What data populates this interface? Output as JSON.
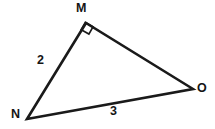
{
  "figure": {
    "name": "right-triangle-mno",
    "kind": "geometry-diagram",
    "background_color": "#ffffff",
    "stroke_color": "#1a1a1a",
    "text_color": "#151515",
    "stroke_width": 2.6,
    "vertices": [
      {
        "id": "M",
        "label": "M",
        "x": 86,
        "y": 23
      },
      {
        "id": "N",
        "label": "N",
        "x": 27,
        "y": 119
      },
      {
        "id": "O",
        "label": "O",
        "x": 193,
        "y": 89
      }
    ],
    "edges": [
      {
        "id": "MN",
        "from": "M",
        "to": "N",
        "label": "2"
      },
      {
        "id": "MO",
        "from": "M",
        "to": "O",
        "label": ""
      },
      {
        "id": "NO",
        "from": "N",
        "to": "O",
        "label": "3"
      }
    ],
    "angle_markers": [
      {
        "id": "right-angle-at-M",
        "at": "M",
        "type": "square",
        "size": 11
      }
    ],
    "side_labels": {
      "MN": "2",
      "NO": "3"
    },
    "vertex_labels": {
      "M": "M",
      "N": "N",
      "O": "O"
    },
    "marker_paths": {
      "triangle": "M 86 23 L 27 119 L 193 89 Z",
      "right_angle_square": "M 81.2 29.7 L 85.3 22.5 L 93.0 26.9 L 88.9 34.1 Z"
    }
  }
}
